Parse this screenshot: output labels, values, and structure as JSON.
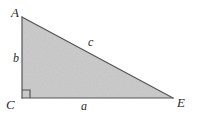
{
  "figure": {
    "kind": "right-triangle-diagram",
    "background_color": "#ffffff",
    "fill_color": "#c9c9c9",
    "stroke_color": "#555555",
    "label_color": "#2b2b2b"
  },
  "vertices": {
    "apex": {
      "name": "A",
      "x": 22,
      "y": 17
    },
    "right_angle": {
      "name": "C",
      "x": 22,
      "y": 98
    },
    "base_right": {
      "name": "E",
      "x": 173,
      "y": 98
    }
  },
  "sides": {
    "vertical": {
      "name": "b",
      "from": "A",
      "to": "C"
    },
    "horizontal": {
      "name": "a",
      "from": "C",
      "to": "E"
    },
    "hypotenuse": {
      "name": "c",
      "from": "A",
      "to": "E"
    }
  },
  "markers": {
    "right_angle_marker": {
      "at": "C",
      "size": 8
    }
  }
}
